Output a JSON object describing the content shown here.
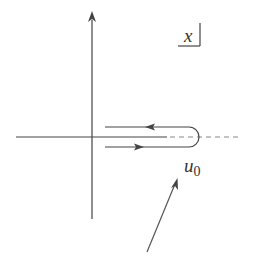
{
  "diagram": {
    "type": "contour-integral-diagram",
    "plane_label": "x",
    "point_label": "u",
    "point_subscript": "0",
    "colors": {
      "line": "#444444",
      "dashed": "#888888",
      "text": "#333333",
      "background": "#ffffff"
    },
    "elements": [
      "vertical-axis-with-arrow",
      "horizontal-axis",
      "hairpin-contour-upper-leftward",
      "hairpin-contour-lower-rightward",
      "branch-cut-dashed",
      "pointer-arrow-to-u0"
    ]
  }
}
